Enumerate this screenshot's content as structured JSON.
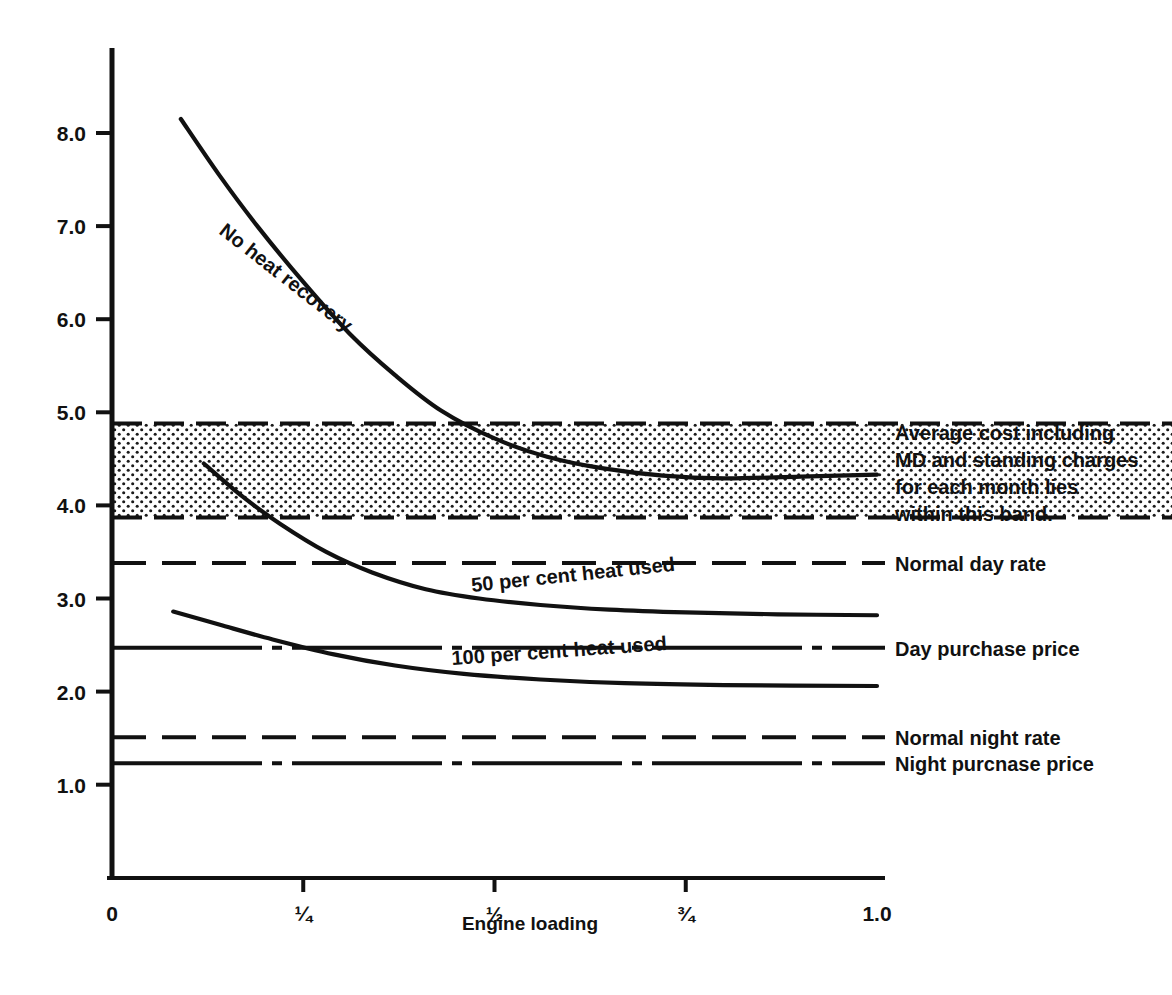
{
  "chart_data": {
    "type": "line",
    "title": "",
    "xlabel": "Engine loading",
    "ylabel": "",
    "xlim": [
      0,
      1.0
    ],
    "ylim": [
      0.55,
      8.9
    ],
    "grid": false,
    "legend_position": "right-of-plot",
    "x_ticks": [
      {
        "value": 0,
        "label": "0"
      },
      {
        "value": 0.25,
        "label": "¼"
      },
      {
        "value": 0.5,
        "label": "½"
      },
      {
        "value": 0.75,
        "label": "¾"
      },
      {
        "value": 1.0,
        "label": "1.0"
      }
    ],
    "y_ticks": [
      {
        "value": 1.0,
        "label": "1.0"
      },
      {
        "value": 2.0,
        "label": "2.0"
      },
      {
        "value": 3.0,
        "label": "3.0"
      },
      {
        "value": 4.0,
        "label": "4.0"
      },
      {
        "value": 5.0,
        "label": "5.0"
      },
      {
        "value": 6.0,
        "label": "6.0"
      },
      {
        "value": 7.0,
        "label": "7.0"
      },
      {
        "value": 8.0,
        "label": "8.0"
      }
    ],
    "band": {
      "label": "Average cost including MD and standing charges for each month lies within this band.",
      "y_top": 4.88,
      "y_bottom": 3.87,
      "fill": "stipple-dots",
      "border_style": "dashed",
      "color": "#111111"
    },
    "series": [
      {
        "name": "No heat recovery",
        "style": "solid",
        "label_rotation_deg": 38,
        "points": [
          {
            "x": 0.09,
            "y": 8.15
          },
          {
            "x": 0.14,
            "y": 7.55
          },
          {
            "x": 0.19,
            "y": 7.0
          },
          {
            "x": 0.25,
            "y": 6.4
          },
          {
            "x": 0.31,
            "y": 5.85
          },
          {
            "x": 0.37,
            "y": 5.4
          },
          {
            "x": 0.43,
            "y": 5.02
          },
          {
            "x": 0.5,
            "y": 4.72
          },
          {
            "x": 0.57,
            "y": 4.52
          },
          {
            "x": 0.64,
            "y": 4.4
          },
          {
            "x": 0.72,
            "y": 4.32
          },
          {
            "x": 0.8,
            "y": 4.29
          },
          {
            "x": 0.9,
            "y": 4.31
          },
          {
            "x": 1.0,
            "y": 4.33
          }
        ]
      },
      {
        "name": "50 per cent heat used",
        "style": "solid",
        "label_rotation_deg": 6,
        "points": [
          {
            "x": 0.12,
            "y": 4.45
          },
          {
            "x": 0.17,
            "y": 4.1
          },
          {
            "x": 0.22,
            "y": 3.8
          },
          {
            "x": 0.28,
            "y": 3.5
          },
          {
            "x": 0.34,
            "y": 3.28
          },
          {
            "x": 0.41,
            "y": 3.1
          },
          {
            "x": 0.48,
            "y": 3.0
          },
          {
            "x": 0.56,
            "y": 2.93
          },
          {
            "x": 0.65,
            "y": 2.88
          },
          {
            "x": 0.75,
            "y": 2.85
          },
          {
            "x": 0.87,
            "y": 2.83
          },
          {
            "x": 1.0,
            "y": 2.82
          }
        ]
      },
      {
        "name": "100 per cent heat used",
        "style": "solid",
        "label_rotation_deg": 4,
        "points": [
          {
            "x": 0.08,
            "y": 2.86
          },
          {
            "x": 0.14,
            "y": 2.72
          },
          {
            "x": 0.21,
            "y": 2.56
          },
          {
            "x": 0.29,
            "y": 2.4
          },
          {
            "x": 0.37,
            "y": 2.28
          },
          {
            "x": 0.46,
            "y": 2.19
          },
          {
            "x": 0.56,
            "y": 2.13
          },
          {
            "x": 0.67,
            "y": 2.09
          },
          {
            "x": 0.8,
            "y": 2.07
          },
          {
            "x": 1.0,
            "y": 2.06
          }
        ]
      }
    ],
    "reference_lines": [
      {
        "name": "Normal day rate",
        "y": 3.38,
        "style": "dashed",
        "label": "Normal day rate"
      },
      {
        "name": "Day purchase price",
        "y": 2.47,
        "style": "dash-dot",
        "label": "Day purchase price"
      },
      {
        "name": "Normal night rate",
        "y": 1.51,
        "style": "dashed",
        "label": "Normal night rate"
      },
      {
        "name": "Night purchase price",
        "y": 1.23,
        "style": "dash-dot",
        "label": "Night purcnase price"
      }
    ]
  },
  "figure": {
    "x_axis_title": "Engine loading",
    "curve_labels": {
      "no_heat_recovery": "No heat recovery",
      "fifty_per_cent": "50 per cent heat used",
      "hundred_per_cent": "100 per cent heat used"
    },
    "band_note_lines": [
      "Average cost including",
      "MD and standing charges",
      "for each month lies",
      "within this band."
    ],
    "side_labels": {
      "normal_day_rate": "Normal day rate",
      "day_purchase_price": "Day purchase price",
      "normal_night_rate": "Normal night rate",
      "night_purchase_price": "Night purcnase price"
    },
    "x_tick_labels": [
      "0",
      "¼",
      "½",
      "¾",
      "1.0"
    ],
    "y_tick_labels": [
      "1.0",
      "2.0",
      "3.0",
      "4.0",
      "5.0",
      "6.0",
      "7.0",
      "8.0"
    ],
    "colors": {
      "ink": "#111111",
      "background": "#ffffff"
    }
  }
}
